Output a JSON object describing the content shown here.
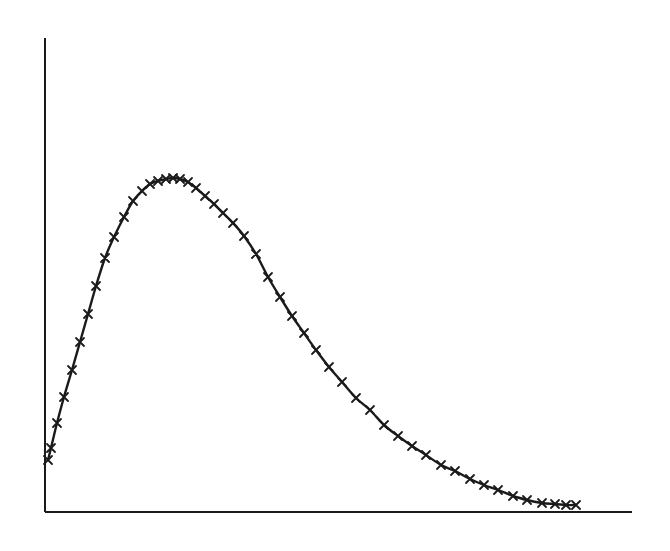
{
  "chart_data": {
    "type": "line",
    "title": "",
    "xlabel": "",
    "ylabel": "",
    "grid": false,
    "legend": null,
    "marker": "x",
    "line_color": "#1a1a1a",
    "axis_color": "#1a1a1a",
    "pixel_frame": {
      "x0": 45,
      "x1": 632,
      "y_axis_top": 38,
      "y_baseline": 512
    },
    "points": [
      [
        48,
        460
      ],
      [
        51,
        448
      ],
      [
        57,
        423
      ],
      [
        64,
        397
      ],
      [
        72,
        370
      ],
      [
        80,
        342
      ],
      [
        88,
        314
      ],
      [
        96,
        286
      ],
      [
        105,
        258
      ],
      [
        114,
        237
      ],
      [
        124,
        217
      ],
      [
        133,
        201
      ],
      [
        142,
        191
      ],
      [
        150,
        184
      ],
      [
        158,
        181
      ],
      [
        166,
        179
      ],
      [
        173,
        178
      ],
      [
        180,
        179
      ],
      [
        188,
        182
      ],
      [
        196,
        188
      ],
      [
        205,
        196
      ],
      [
        214,
        204
      ],
      [
        223,
        213
      ],
      [
        233,
        223
      ],
      [
        244,
        236
      ],
      [
        256,
        254
      ],
      [
        268,
        277
      ],
      [
        280,
        297
      ],
      [
        292,
        316
      ],
      [
        304,
        333
      ],
      [
        316,
        350
      ],
      [
        329,
        367
      ],
      [
        342,
        382
      ],
      [
        356,
        398
      ],
      [
        370,
        410
      ],
      [
        384,
        425
      ],
      [
        398,
        436
      ],
      [
        412,
        446
      ],
      [
        426,
        455
      ],
      [
        441,
        465
      ],
      [
        455,
        471
      ],
      [
        470,
        479
      ],
      [
        484,
        485
      ],
      [
        498,
        490
      ],
      [
        513,
        496
      ],
      [
        527,
        500
      ],
      [
        542,
        503
      ],
      [
        555,
        504
      ],
      [
        566,
        505
      ],
      [
        576,
        505
      ]
    ]
  }
}
